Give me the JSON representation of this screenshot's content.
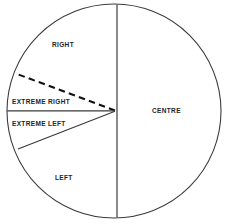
{
  "diagram": {
    "shape": "circle",
    "colors": {
      "background": "#ffffff",
      "stroke": "#3a3a3a",
      "dashed_stroke": "#111111",
      "text": "#242424"
    },
    "geometry": {
      "center_x": 114,
      "center_y": 111,
      "radius": 107,
      "vertical_divider_x": 117
    },
    "labels": {
      "right": "RIGHT",
      "extreme_right": "EXTREME RIGHT",
      "extreme_left": "EXTREME LEFT",
      "left": "LEFT",
      "centre": "CENTRE"
    },
    "sectors": [
      {
        "name": "centre",
        "label": "CENTRE",
        "side": "right-half"
      },
      {
        "name": "right",
        "label": "RIGHT",
        "side": "left-half-upper"
      },
      {
        "name": "extreme-right",
        "label": "EXTREME RIGHT",
        "side": "left-half-upper-middle"
      },
      {
        "name": "extreme-left",
        "label": "EXTREME LEFT",
        "side": "left-half-lower-middle"
      },
      {
        "name": "left",
        "label": "LEFT",
        "side": "left-half-lower"
      }
    ],
    "dividers": [
      {
        "name": "vertical-divider",
        "style": "solid",
        "from": "top-of-circle",
        "to": "bottom-of-circle"
      },
      {
        "name": "extreme-right-boundary",
        "style": "dashed",
        "from": "center",
        "to": "upper-left-arc"
      },
      {
        "name": "horizontal-divider",
        "style": "solid",
        "from": "center",
        "to": "left-arc"
      },
      {
        "name": "extreme-left-boundary",
        "style": "solid",
        "from": "center",
        "to": "lower-left-arc"
      }
    ]
  }
}
